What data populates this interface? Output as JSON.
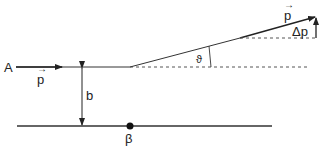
{
  "diagram": {
    "labels": {
      "particle": "A",
      "incoming_momentum": "p",
      "outgoing_momentum": "p",
      "impact_parameter": "b",
      "scattering_angle": "ϑ",
      "momentum_transfer": "Δp",
      "target": "β"
    },
    "colors": {
      "line": "#333333",
      "dashed": "#555555",
      "text": "#222222"
    }
  }
}
